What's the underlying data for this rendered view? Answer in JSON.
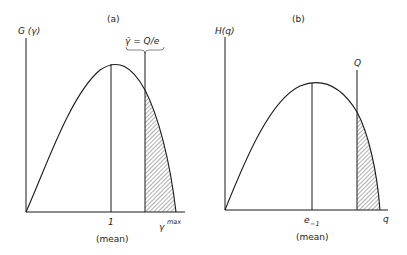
{
  "panels": [
    {
      "id": "a",
      "title": "(a)",
      "y_axis_label": "G (γ)",
      "x_axis_label": "γ",
      "x_axis_label_sup": "max",
      "mean_tick_label": "1",
      "mean_caption": "(mean)",
      "threshold_label": "γ̄ = Q/e",
      "shaded_region": "tail beyond γ̄ up to γ max"
    },
    {
      "id": "b",
      "title": "(b)",
      "y_axis_label": "H(q)",
      "x_axis_label": "q",
      "mean_tick_label": "e",
      "mean_tick_sub": "−1",
      "mean_caption": "(mean)",
      "threshold_label": "Q",
      "shaded_region": "tail beyond Q"
    }
  ],
  "colors": {
    "line": "#1a1a1a",
    "background": "#ffffff"
  }
}
